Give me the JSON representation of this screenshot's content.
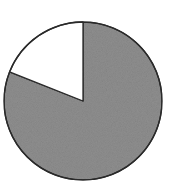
{
  "chart_data": {
    "type": "pie",
    "title": "",
    "categories": [
      "Gray",
      "White"
    ],
    "values": [
      81,
      19
    ],
    "colors": [
      "#8f8f8f",
      "#ffffff"
    ],
    "start_angle_deg": 0,
    "direction": "clockwise-from-top",
    "legend": "none",
    "labels_shown": false,
    "center": [
      83,
      101
    ],
    "radius": 79,
    "stroke_color": "#2a2a2a"
  }
}
